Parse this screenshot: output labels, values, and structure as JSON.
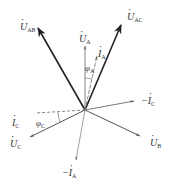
{
  "diagram": {
    "type": "phasor-diagram",
    "origin": [
      85,
      110
    ],
    "colors": {
      "heavy": "#222222",
      "light": "#666666",
      "text": "#333333"
    },
    "phasors": [
      {
        "id": "U_AB",
        "symbol": "U",
        "sub": "AB",
        "dotted": true,
        "tip": [
          38,
          28
        ],
        "weight": "heavy",
        "style": "solid",
        "label_pos": [
          20,
          22
        ]
      },
      {
        "id": "U_AC",
        "symbol": "U",
        "sub": "AC",
        "dotted": true,
        "tip": [
          121,
          25
        ],
        "weight": "heavy",
        "style": "solid",
        "label_pos": [
          127,
          12
        ]
      },
      {
        "id": "U_A",
        "symbol": "U",
        "sub": "A",
        "dotted": true,
        "tip": [
          85,
          46
        ],
        "weight": "light",
        "style": "solid",
        "label_pos": [
          79,
          34
        ]
      },
      {
        "id": "I_A",
        "symbol": "I",
        "sub": "A",
        "dotted": true,
        "tip": [
          97,
          56
        ],
        "weight": "light",
        "style": "solid",
        "label_pos": [
          98,
          49
        ]
      },
      {
        "id": "neg_I_C",
        "symbol": "−I",
        "sub": "C",
        "dotted": true,
        "tip": [
          134,
          101
        ],
        "weight": "light",
        "style": "solid",
        "label_pos": [
          141,
          96
        ]
      },
      {
        "id": "U_B",
        "symbol": "U",
        "sub": "B",
        "dotted": true,
        "tip": [
          140,
          136
        ],
        "weight": "light",
        "style": "solid",
        "label_pos": [
          150,
          138
        ]
      },
      {
        "id": "U_C",
        "symbol": "U",
        "sub": "C",
        "dotted": true,
        "tip": [
          30,
          137
        ],
        "weight": "light",
        "style": "solid",
        "label_pos": [
          10,
          139
        ]
      },
      {
        "id": "I_C",
        "symbol": "I",
        "sub": "C",
        "dotted": true,
        "tip": [
          36,
          113
        ],
        "weight": "light",
        "style": "dashed",
        "label_pos": [
          12,
          118
        ]
      },
      {
        "id": "neg_I_A",
        "symbol": "−I",
        "sub": "A",
        "dotted": true,
        "tip": [
          76,
          160
        ],
        "weight": "light",
        "style": "solid",
        "label_pos": [
          62,
          168
        ]
      }
    ],
    "angles": [
      {
        "id": "phi_A",
        "symbol": "φ",
        "sub": "A",
        "label_pos": [
          85,
          63
        ]
      },
      {
        "id": "phi_C",
        "symbol": "φ",
        "sub": "C",
        "label_pos": [
          36,
          118
        ]
      }
    ]
  }
}
